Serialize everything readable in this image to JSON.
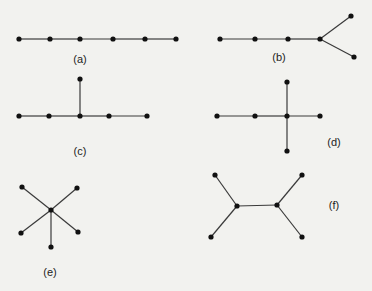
{
  "diagram": {
    "title": "",
    "colors": {
      "background": "#f2f2ef",
      "edge": "#3a3a3a",
      "node": "#111111",
      "label": "#222222"
    },
    "graphs": [
      {
        "id": "a",
        "label": "(a)",
        "label_pos": [
          80,
          60
        ],
        "nodes": [
          [
            19,
            39
          ],
          [
            50,
            39
          ],
          [
            80,
            39
          ],
          [
            113,
            39
          ],
          [
            145,
            39
          ],
          [
            176,
            39
          ]
        ],
        "edges": [
          [
            0,
            1
          ],
          [
            1,
            2
          ],
          [
            2,
            3
          ],
          [
            3,
            4
          ],
          [
            4,
            5
          ]
        ]
      },
      {
        "id": "b",
        "label": "(b)",
        "label_pos": [
          279,
          58
        ],
        "nodes": [
          [
            220,
            39
          ],
          [
            255,
            39
          ],
          [
            288,
            39
          ],
          [
            320,
            39
          ],
          [
            351,
            16
          ],
          [
            354,
            57
          ]
        ],
        "edges": [
          [
            0,
            1
          ],
          [
            1,
            2
          ],
          [
            2,
            3
          ],
          [
            3,
            4
          ],
          [
            3,
            5
          ]
        ]
      },
      {
        "id": "c",
        "label": "(c)",
        "label_pos": [
          80,
          152
        ],
        "nodes": [
          [
            19,
            116
          ],
          [
            49,
            116
          ],
          [
            80,
            116
          ],
          [
            109,
            116
          ],
          [
            147,
            116
          ],
          [
            80,
            79
          ]
        ],
        "edges": [
          [
            0,
            1
          ],
          [
            1,
            2
          ],
          [
            2,
            3
          ],
          [
            3,
            4
          ],
          [
            2,
            5
          ]
        ]
      },
      {
        "id": "d",
        "label": "(d)",
        "label_pos": [
          334,
          143
        ],
        "nodes": [
          [
            217,
            116
          ],
          [
            255,
            116
          ],
          [
            287,
            116
          ],
          [
            320,
            116
          ],
          [
            287,
            82
          ],
          [
            287,
            151
          ]
        ],
        "edges": [
          [
            0,
            1
          ],
          [
            1,
            2
          ],
          [
            2,
            3
          ],
          [
            2,
            4
          ],
          [
            2,
            5
          ]
        ]
      },
      {
        "id": "e",
        "label": "(e)",
        "label_pos": [
          50,
          273
        ],
        "nodes": [
          [
            51,
            210
          ],
          [
            22,
            187
          ],
          [
            77,
            188
          ],
          [
            21,
            233
          ],
          [
            78,
            232
          ],
          [
            51,
            247
          ]
        ],
        "edges": [
          [
            0,
            1
          ],
          [
            0,
            2
          ],
          [
            0,
            3
          ],
          [
            0,
            4
          ],
          [
            0,
            5
          ]
        ]
      },
      {
        "id": "f",
        "label": "(f)",
        "label_pos": [
          334,
          206
        ],
        "nodes": [
          [
            237,
            206
          ],
          [
            277,
            205
          ],
          [
            215,
            175
          ],
          [
            211,
            237
          ],
          [
            302,
            175
          ],
          [
            302,
            237
          ]
        ],
        "edges": [
          [
            0,
            1
          ],
          [
            0,
            2
          ],
          [
            0,
            3
          ],
          [
            1,
            4
          ],
          [
            1,
            5
          ]
        ]
      }
    ]
  }
}
